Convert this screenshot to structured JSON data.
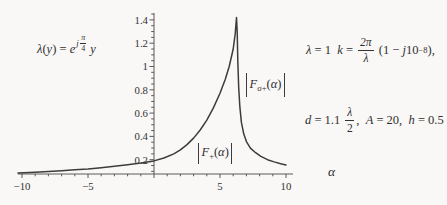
{
  "colors": {
    "background": "#f9f8f6",
    "ink": "#2f2f2f",
    "axis": "#4a4a4a",
    "curve": "#3c3c3c"
  },
  "formulas": {
    "lambda_def": {
      "tokens": [
        {
          "t": "λ",
          "i": true
        },
        {
          "t": "(",
          "i": false
        },
        {
          "t": "y",
          "i": true
        },
        {
          "t": ") = ",
          "i": false
        },
        {
          "t": "e",
          "i": true
        },
        {
          "supfrac": {
            "pre": "j",
            "n": "π",
            "d": "4"
          }
        },
        {
          "t": " ",
          "i": false
        },
        {
          "t": "y",
          "i": true
        }
      ]
    },
    "params_line1": {
      "tokens": [
        {
          "t": "λ",
          "i": true
        },
        {
          "t": " = 1  ",
          "i": false
        },
        {
          "t": "k",
          "i": true
        },
        {
          "t": " = ",
          "i": false
        },
        {
          "frac": {
            "n": "2π",
            "d": "λ",
            "ni": true,
            "di": true
          }
        },
        {
          "t": " (1 − ",
          "i": false
        },
        {
          "t": "j",
          "i": true
        },
        {
          "t": "10",
          "i": false
        },
        {
          "sup": "−8"
        },
        {
          "t": "),",
          "i": false
        }
      ]
    },
    "params_line2": {
      "tokens": [
        {
          "t": "d",
          "i": true
        },
        {
          "t": " = 1.1 ",
          "i": false
        },
        {
          "frac": {
            "n": "λ",
            "d": "2",
            "ni": true,
            "di": false
          }
        },
        {
          "t": ",  ",
          "i": false
        },
        {
          "t": "A",
          "i": true
        },
        {
          "t": " = 20,  ",
          "i": false
        },
        {
          "t": "h",
          "i": true
        },
        {
          "t": " = 0.5",
          "i": false
        }
      ]
    }
  },
  "curve_labels": {
    "upper": {
      "tokens": [
        {
          "t": "F",
          "i": true
        },
        {
          "sub": "σ+"
        },
        {
          "t": "(",
          "i": false
        },
        {
          "t": "α",
          "i": true
        },
        {
          "t": ")",
          "i": false
        }
      ]
    },
    "lower": {
      "tokens": [
        {
          "t": "F",
          "i": true
        },
        {
          "sub": "+"
        },
        {
          "t": "(",
          "i": false
        },
        {
          "t": "α",
          "i": true
        },
        {
          "t": ")",
          "i": false
        }
      ]
    }
  },
  "chart_data": {
    "type": "line",
    "title": "",
    "xlabel": "α",
    "ylabel": "",
    "xlim": [
      -10.5,
      10.5
    ],
    "ylim": [
      0,
      1.45
    ],
    "x_major_ticks": [
      -10,
      -5,
      5,
      10
    ],
    "x_tick_labels": [
      "−10",
      "−5",
      "5",
      "10"
    ],
    "x_minor_step": 1,
    "y_major_ticks": [
      0.2,
      0.4,
      0.6,
      0.8,
      1,
      1.2,
      1.4
    ],
    "y_tick_labels": [
      "0.2",
      "0.4",
      "0.6",
      "0.8",
      "1",
      "1.2",
      "1.4"
    ],
    "y_minor_step": 0.05,
    "grid": false,
    "legend": "none",
    "peak": {
      "alpha": 6.25,
      "value": 1.42
    },
    "series": [
      {
        "name": "|F+(α)| left branch joining |Fσ+(α)| right branch",
        "points": [
          [
            -10.3,
            0.085
          ],
          [
            -9,
            0.092
          ],
          [
            -8,
            0.098
          ],
          [
            -7,
            0.105
          ],
          [
            -6,
            0.113
          ],
          [
            -5,
            0.121
          ],
          [
            -4,
            0.131
          ],
          [
            -3,
            0.143
          ],
          [
            -2,
            0.157
          ],
          [
            -1,
            0.172
          ],
          [
            0,
            0.19
          ],
          [
            0.75,
            0.215
          ],
          [
            1.5,
            0.25
          ],
          [
            2,
            0.285
          ],
          [
            2.5,
            0.33
          ],
          [
            3,
            0.385
          ],
          [
            3.5,
            0.455
          ],
          [
            4,
            0.54
          ],
          [
            4.5,
            0.645
          ],
          [
            5,
            0.77
          ],
          [
            5.4,
            0.89
          ],
          [
            5.7,
            1.0
          ],
          [
            6.0,
            1.15
          ],
          [
            6.15,
            1.28
          ],
          [
            6.25,
            1.42
          ],
          [
            6.3,
            1.3
          ],
          [
            6.35,
            1.05
          ],
          [
            6.42,
            0.82
          ],
          [
            6.5,
            0.66
          ],
          [
            6.62,
            0.52
          ],
          [
            6.8,
            0.42
          ],
          [
            7.0,
            0.355
          ],
          [
            7.3,
            0.3
          ],
          [
            7.7,
            0.26
          ],
          [
            8.1,
            0.228
          ],
          [
            8.6,
            0.2
          ],
          [
            9.1,
            0.181
          ],
          [
            9.6,
            0.166
          ],
          [
            10.0,
            0.155
          ]
        ]
      }
    ]
  }
}
